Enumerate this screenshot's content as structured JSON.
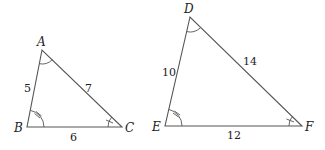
{
  "triangles": [
    {
      "name": "ABC",
      "vertices": {
        "A": {
          "label": "A",
          "x": 42,
          "y": 50
        },
        "B": {
          "label": "B",
          "x": 27,
          "y": 127
        },
        "C": {
          "label": "C",
          "x": 122,
          "y": 127
        }
      },
      "sides": {
        "AB": "5",
        "AC": "7",
        "BC": "6"
      },
      "angle_marks": {
        "A": "single-arc",
        "B": "arc-with-double-tick",
        "C": "arc-with-single-tick"
      }
    },
    {
      "name": "DEF",
      "vertices": {
        "D": {
          "label": "D",
          "x": 190,
          "y": 17
        },
        "E": {
          "label": "E",
          "x": 165,
          "y": 126
        },
        "F": {
          "label": "F",
          "x": 302,
          "y": 126
        }
      },
      "sides": {
        "DE": "10",
        "DF": "14",
        "EF": "12"
      },
      "angle_marks": {
        "D": "single-arc",
        "E": "arc-with-double-tick",
        "F": "arc-with-single-tick"
      }
    }
  ],
  "labels": {
    "A": "A",
    "B": "B",
    "C": "C",
    "D": "D",
    "E": "E",
    "F": "F",
    "AB": "5",
    "AC": "7",
    "BC": "6",
    "DE": "10",
    "DF": "14",
    "EF": "12"
  },
  "colors": {
    "line": "#555555",
    "text": "#222222",
    "background": "#ffffff"
  }
}
